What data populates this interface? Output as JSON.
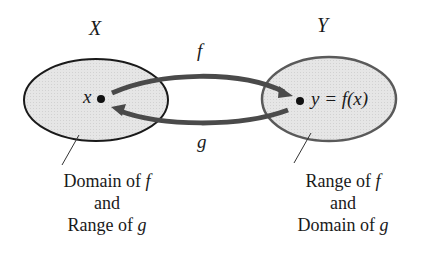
{
  "diagram": {
    "sets": {
      "left": {
        "name": "X",
        "element": "x",
        "caption": {
          "line1_prefix": "Domain of ",
          "line1_var": "f",
          "line2": "and",
          "line3_prefix": "Range of ",
          "line3_var": "g"
        }
      },
      "right": {
        "name": "Y",
        "element": "y = f(x)",
        "caption": {
          "line1_prefix": "Range of ",
          "line1_var": "f",
          "line2": "and",
          "line3_prefix": "Domain of ",
          "line3_var": "g"
        }
      }
    },
    "arrows": {
      "top": "f",
      "bottom": "g"
    },
    "colors": {
      "fill": "#e4e4e4",
      "left_stroke": "#1a1a1a",
      "right_stroke": "#555555",
      "arrow": "#4a4a4a"
    }
  }
}
